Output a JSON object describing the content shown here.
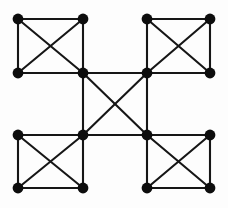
{
  "figure": {
    "kind": "graph-diagram",
    "background_color": "#fdfdfd",
    "width": 228,
    "height": 208
  },
  "style": {
    "node_color": "#0d0d0d",
    "node_radius": 5.4,
    "edge_color": "#161616",
    "edge_width": 2.1
  },
  "graph": {
    "node_count": 16,
    "edge_count": 34,
    "grid_x": [
      18,
      83,
      147,
      210
    ],
    "grid_y": [
      19,
      73,
      135,
      188
    ],
    "nodes": [
      {
        "id": "n1",
        "label": "1",
        "x": 18,
        "y": 19,
        "group": "top-left"
      },
      {
        "id": "n2",
        "label": "2",
        "x": 83,
        "y": 19,
        "group": "top-left"
      },
      {
        "id": "n3",
        "label": "3",
        "x": 147,
        "y": 19,
        "group": "top-right"
      },
      {
        "id": "n4",
        "label": "4",
        "x": 210,
        "y": 19,
        "group": "top-right"
      },
      {
        "id": "n5",
        "label": "5",
        "x": 18,
        "y": 73,
        "group": "top-left"
      },
      {
        "id": "n6",
        "label": "6",
        "x": 83,
        "y": 73,
        "group": "center"
      },
      {
        "id": "n7",
        "label": "7",
        "x": 147,
        "y": 73,
        "group": "center"
      },
      {
        "id": "n8",
        "label": "8",
        "x": 210,
        "y": 73,
        "group": "top-right"
      },
      {
        "id": "n9",
        "label": "9",
        "x": 18,
        "y": 135,
        "group": "bottom-left"
      },
      {
        "id": "n10",
        "label": "10",
        "x": 83,
        "y": 135,
        "group": "center"
      },
      {
        "id": "n11",
        "label": "11",
        "x": 147,
        "y": 135,
        "group": "center"
      },
      {
        "id": "n12",
        "label": "12",
        "x": 210,
        "y": 135,
        "group": "bottom-right"
      },
      {
        "id": "n13",
        "label": "13",
        "x": 18,
        "y": 188,
        "group": "bottom-left"
      },
      {
        "id": "n14",
        "label": "14",
        "x": 83,
        "y": 188,
        "group": "bottom-left"
      },
      {
        "id": "n15",
        "label": "15",
        "x": 147,
        "y": 188,
        "group": "bottom-right"
      },
      {
        "id": "n16",
        "label": "16",
        "x": 210,
        "y": 188,
        "group": "bottom-right"
      }
    ],
    "edges": [
      {
        "from": "n1",
        "to": "n2",
        "kind": "side",
        "clique": "top-left"
      },
      {
        "from": "n1",
        "to": "n5",
        "kind": "side",
        "clique": "top-left"
      },
      {
        "from": "n2",
        "to": "n6",
        "kind": "side",
        "clique": "top-left"
      },
      {
        "from": "n5",
        "to": "n6",
        "kind": "side",
        "clique": "top-left"
      },
      {
        "from": "n1",
        "to": "n6",
        "kind": "diagonal",
        "clique": "top-left"
      },
      {
        "from": "n2",
        "to": "n5",
        "kind": "diagonal",
        "clique": "top-left"
      },
      {
        "from": "n3",
        "to": "n4",
        "kind": "side",
        "clique": "top-right"
      },
      {
        "from": "n3",
        "to": "n7",
        "kind": "side",
        "clique": "top-right"
      },
      {
        "from": "n4",
        "to": "n8",
        "kind": "side",
        "clique": "top-right"
      },
      {
        "from": "n7",
        "to": "n8",
        "kind": "side",
        "clique": "top-right"
      },
      {
        "from": "n3",
        "to": "n8",
        "kind": "diagonal",
        "clique": "top-right"
      },
      {
        "from": "n4",
        "to": "n7",
        "kind": "diagonal",
        "clique": "top-right"
      },
      {
        "from": "n9",
        "to": "n10",
        "kind": "side",
        "clique": "bottom-left"
      },
      {
        "from": "n9",
        "to": "n13",
        "kind": "side",
        "clique": "bottom-left"
      },
      {
        "from": "n10",
        "to": "n14",
        "kind": "side",
        "clique": "bottom-left"
      },
      {
        "from": "n13",
        "to": "n14",
        "kind": "side",
        "clique": "bottom-left"
      },
      {
        "from": "n9",
        "to": "n14",
        "kind": "diagonal",
        "clique": "bottom-left"
      },
      {
        "from": "n10",
        "to": "n13",
        "kind": "diagonal",
        "clique": "bottom-left"
      },
      {
        "from": "n11",
        "to": "n12",
        "kind": "side",
        "clique": "bottom-right"
      },
      {
        "from": "n11",
        "to": "n15",
        "kind": "side",
        "clique": "bottom-right"
      },
      {
        "from": "n12",
        "to": "n16",
        "kind": "side",
        "clique": "bottom-right"
      },
      {
        "from": "n15",
        "to": "n16",
        "kind": "side",
        "clique": "bottom-right"
      },
      {
        "from": "n11",
        "to": "n16",
        "kind": "diagonal",
        "clique": "bottom-right"
      },
      {
        "from": "n12",
        "to": "n15",
        "kind": "diagonal",
        "clique": "bottom-right"
      },
      {
        "from": "n6",
        "to": "n7",
        "kind": "side",
        "clique": "center"
      },
      {
        "from": "n6",
        "to": "n10",
        "kind": "side",
        "clique": "center"
      },
      {
        "from": "n7",
        "to": "n11",
        "kind": "side",
        "clique": "center"
      },
      {
        "from": "n10",
        "to": "n11",
        "kind": "side",
        "clique": "center"
      },
      {
        "from": "n6",
        "to": "n11",
        "kind": "diagonal",
        "clique": "center"
      },
      {
        "from": "n7",
        "to": "n10",
        "kind": "diagonal",
        "clique": "center"
      },
      {
        "from": "n7",
        "to": "n8",
        "kind": "link",
        "clique": "row-2"
      },
      {
        "from": "n5",
        "to": "n6",
        "kind": "link",
        "clique": "row-2"
      },
      {
        "from": "n9",
        "to": "n10",
        "kind": "link",
        "clique": "row-3"
      },
      {
        "from": "n11",
        "to": "n12",
        "kind": "link",
        "clique": "row-3"
      }
    ]
  }
}
